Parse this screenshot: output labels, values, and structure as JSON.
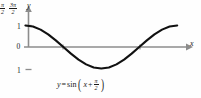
{
  "figure": {
    "name": "sine-phase-shift-graph",
    "background_color": "#fefefe",
    "curve_color": "#111111",
    "axis_color": "#8c8c8c"
  },
  "axes": {
    "x_axis_label": "x",
    "y_axis_label": "y",
    "x_ticks": [
      {
        "label_num": "π",
        "label_den": "2",
        "x_value": 1.5708
      },
      {
        "label_num": "3π",
        "label_den": "2",
        "x_value": 4.7124
      }
    ],
    "y_ticks": [
      {
        "label": "1",
        "value": 1
      },
      {
        "label": "0",
        "value": 0
      },
      {
        "label": "1",
        "value": -1
      }
    ]
  },
  "caption": {
    "lhs": "y",
    "equals": "=",
    "func": "sin",
    "open_paren": "(",
    "arg_var": "x",
    "plus": "+",
    "frac_num": "π",
    "frac_den": "2",
    "close_paren": ")"
  },
  "chart_data": {
    "type": "line",
    "title": "",
    "xlabel": "x",
    "ylabel": "y",
    "grid": false,
    "legend": "none",
    "xlim": [
      -0.35,
      6.6
    ],
    "ylim": [
      -1.35,
      1.35
    ],
    "xtick_labels": [
      "π/2",
      "3π/2"
    ],
    "xtick_values": [
      1.5708,
      4.7124
    ],
    "ytick_labels": [
      "1",
      "0",
      "1"
    ],
    "ytick_values": [
      1,
      0,
      -1
    ],
    "annotations": [
      "y = sin(x + π/2)"
    ],
    "series": [
      {
        "name": "y = sin(x + π/2)",
        "x": [
          0,
          0.3142,
          0.6283,
          0.9425,
          1.2566,
          1.5708,
          1.885,
          2.1991,
          2.5133,
          2.8274,
          3.1416,
          3.4558,
          3.7699,
          4.0841,
          4.3982,
          4.7124,
          5.0265,
          5.3407,
          5.6549,
          5.969,
          6.2832
        ],
        "y": [
          1,
          0.951,
          0.809,
          0.588,
          0.309,
          0,
          -0.309,
          -0.588,
          -0.809,
          -0.951,
          -1,
          -0.951,
          -0.809,
          -0.588,
          -0.309,
          0,
          0.309,
          0.588,
          0.809,
          0.951,
          1
        ]
      }
    ]
  }
}
